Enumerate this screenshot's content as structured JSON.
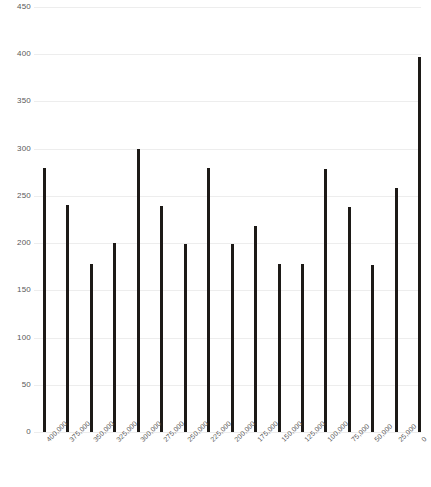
{
  "chart_data": {
    "type": "bar",
    "title": "",
    "subtitle": "",
    "xlabel": "",
    "ylabel": "",
    "categories": [
      "400,000",
      "375,000",
      "350,000",
      "325,000",
      "300,000",
      "275,000",
      "250,000",
      "225,000",
      "200,000",
      "175,000",
      "150,000",
      "125,000",
      "100,000",
      "75,000",
      "50,000",
      "25,000",
      "0"
    ],
    "values": [
      280,
      240,
      178,
      200,
      300,
      239,
      199,
      280,
      199,
      218,
      178,
      178,
      279,
      238,
      177,
      258,
      397
    ],
    "ylim": [
      0,
      450
    ],
    "yticks": [
      0,
      50,
      100,
      150,
      200,
      250,
      300,
      350,
      400,
      450
    ],
    "ytick_labels": [
      "0",
      "50",
      "100",
      "150",
      "200",
      "250",
      "300",
      "350",
      "400",
      "450"
    ],
    "grid": true,
    "legend": false,
    "legend_position": "none",
    "bar_color": "#1d1a17",
    "grid_color": "#ededed",
    "tick_label_color": "#595959",
    "background_color": "#ffffff"
  }
}
